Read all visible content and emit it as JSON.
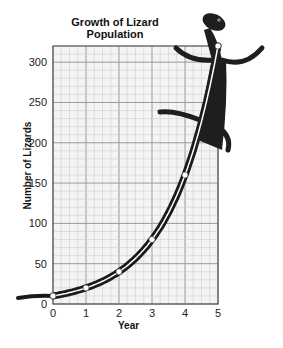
{
  "chart_data": {
    "type": "line",
    "title": "Growth of Lizard Population",
    "xlabel": "Year",
    "ylabel": "Number of Lizards",
    "x": [
      0,
      1,
      2,
      3,
      4,
      5
    ],
    "series": [
      {
        "name": "Lizard Population",
        "values": [
          10,
          20,
          40,
          80,
          160,
          320
        ]
      }
    ],
    "xlim": [
      0,
      5
    ],
    "ylim": [
      0,
      320
    ],
    "x_ticks": [
      "0",
      "1",
      "2",
      "3",
      "4",
      "5"
    ],
    "y_ticks": [
      "0",
      "50",
      "100",
      "150",
      "200",
      "250",
      "300"
    ],
    "grid": true,
    "annotations": [
      "Curve drawn as a lizard illustration along the data"
    ]
  },
  "labels": {
    "title_line1": "Growth of Lizard",
    "title_line2": "Population",
    "ylabel": "Number of Lizards",
    "xlabel": "Year"
  }
}
